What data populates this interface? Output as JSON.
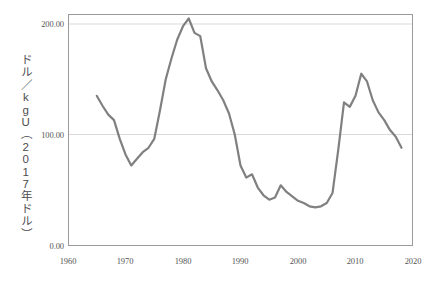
{
  "chart_data": {
    "type": "line",
    "title": "",
    "xlabel": "",
    "ylabel": "ドル／kgU（2017年ドル）",
    "xlim": [
      1960,
      2020
    ],
    "ylim": [
      0,
      200
    ],
    "xticks": [
      "1960",
      "1970",
      "1980",
      "1990",
      "2000",
      "2010",
      "2020"
    ],
    "xtick_values": [
      1960,
      1970,
      1980,
      1990,
      2000,
      2010,
      2020
    ],
    "yticks": [
      "0.00",
      "100.00",
      "200.00"
    ],
    "ytick_values": [
      0,
      100,
      200
    ],
    "grid": "horizontal",
    "legend": "none",
    "line_color": "#808080",
    "line_width": 2.2,
    "axis_color": "#9a9a9a",
    "grid_color": "#d9d9d9",
    "series": [
      {
        "name": "ウラン価格",
        "x": [
          1965,
          1966,
          1967,
          1968,
          1969,
          1970,
          1971,
          1972,
          1973,
          1974,
          1975,
          1976,
          1977,
          1978,
          1979,
          1980,
          1981,
          1982,
          1983,
          1984,
          1985,
          1986,
          1987,
          1988,
          1989,
          1990,
          1991,
          1992,
          1993,
          1994,
          1995,
          1996,
          1997,
          1998,
          1999,
          2000,
          2001,
          2002,
          2003,
          2004,
          2005,
          2006,
          2007,
          2008,
          2009,
          2010,
          2011,
          2012,
          2013,
          2014,
          2015,
          2016,
          2017,
          2018
        ],
        "y": [
          135,
          126,
          118,
          113,
          96,
          82,
          72,
          78,
          84,
          88,
          96,
          122,
          150,
          169,
          186,
          198,
          205,
          192,
          189,
          160,
          148,
          140,
          131,
          119,
          100,
          72,
          61,
          64,
          52,
          45,
          41,
          43,
          54,
          48,
          44,
          40,
          38,
          35,
          34,
          35,
          38,
          47,
          86,
          129,
          125,
          135,
          155,
          148,
          131,
          120,
          113,
          104,
          98,
          88
        ]
      }
    ]
  }
}
